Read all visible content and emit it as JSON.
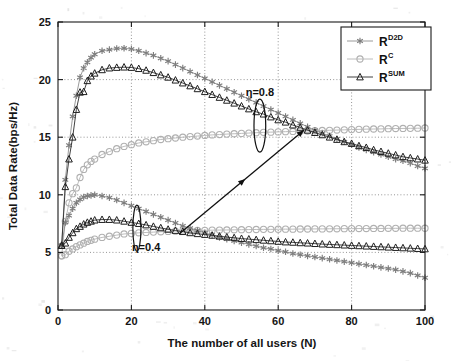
{
  "figure": {
    "background_color": "#ffffff",
    "width": 451,
    "height": 361
  },
  "chart_data": {
    "type": "line",
    "title": "",
    "xlabel": "The number of all users (N)",
    "ylabel": "Total Data Rate(bps/Hz)",
    "xlim": [
      0,
      100
    ],
    "ylim": [
      0,
      25
    ],
    "xticks": [
      0,
      20,
      40,
      60,
      80,
      100
    ],
    "yticks": [
      0,
      5,
      10,
      15,
      20,
      25
    ],
    "grid": true,
    "grid_style": "dotted",
    "legend_position": "upper right",
    "legend_entries": [
      {
        "base": "R",
        "sup": "D2D",
        "marker": "asterisk",
        "color": "#8f8f8f"
      },
      {
        "base": "R",
        "sup": "C",
        "marker": "circle",
        "color": "#b4b4b4"
      },
      {
        "base": "R",
        "sup": "SUM",
        "marker": "triangle",
        "color": "#2b2b2b"
      }
    ],
    "x": [
      1,
      2,
      3,
      4,
      5,
      6,
      7,
      8,
      9,
      10,
      12,
      14,
      16,
      18,
      20,
      22,
      24,
      26,
      28,
      30,
      32,
      34,
      36,
      38,
      40,
      42,
      44,
      46,
      48,
      50,
      52,
      54,
      56,
      58,
      60,
      62,
      64,
      66,
      68,
      70,
      72,
      74,
      76,
      78,
      80,
      82,
      84,
      86,
      88,
      90,
      92,
      94,
      96,
      98,
      100
    ],
    "series": [
      {
        "name": "R^D2D (eta=0.8)",
        "group": "eta_0.8",
        "marker": "asterisk",
        "color": "#8f8f8f",
        "values": [
          5.6,
          11.3,
          14.3,
          16.8,
          18.6,
          20.2,
          21.0,
          21.5,
          21.9,
          22.2,
          22.5,
          22.6,
          22.7,
          22.72,
          22.65,
          22.5,
          22.3,
          22.1,
          21.85,
          21.6,
          21.3,
          21.0,
          20.7,
          20.4,
          20.1,
          19.8,
          19.5,
          19.2,
          18.9,
          18.6,
          18.3,
          18.0,
          17.7,
          17.4,
          17.1,
          16.8,
          16.5,
          16.2,
          15.9,
          15.6,
          15.35,
          15.1,
          14.85,
          14.6,
          14.35,
          14.1,
          13.9,
          13.7,
          13.5,
          13.3,
          13.1,
          12.95,
          12.75,
          12.5,
          12.3
        ]
      },
      {
        "name": "R^C (eta=0.8)",
        "group": "eta_0.8",
        "marker": "circle",
        "color": "#b4b4b4",
        "values": [
          4.7,
          7.7,
          9.3,
          10.1,
          10.6,
          11.5,
          12.2,
          12.6,
          12.9,
          13.1,
          13.5,
          13.75,
          14.0,
          14.2,
          14.35,
          14.5,
          14.6,
          14.7,
          14.8,
          14.87,
          14.93,
          15.0,
          15.05,
          15.1,
          15.15,
          15.2,
          15.23,
          15.27,
          15.3,
          15.33,
          15.36,
          15.39,
          15.42,
          15.44,
          15.46,
          15.48,
          15.5,
          15.52,
          15.54,
          15.56,
          15.58,
          15.6,
          15.62,
          15.64,
          15.66,
          15.68,
          15.7,
          15.71,
          15.72,
          15.74,
          15.75,
          15.76,
          15.77,
          15.78,
          15.8
        ]
      },
      {
        "name": "R^SUM (eta=0.8)",
        "group": "eta_0.8",
        "marker": "triangle",
        "color": "#2b2b2b",
        "values": [
          5.6,
          10.7,
          13.1,
          15.0,
          17.4,
          18.9,
          18.95,
          19.9,
          20.3,
          20.55,
          20.85,
          21.0,
          21.05,
          21.08,
          21.05,
          20.95,
          20.8,
          20.6,
          20.4,
          20.2,
          19.95,
          19.7,
          19.45,
          19.2,
          18.95,
          18.7,
          18.45,
          18.2,
          17.95,
          17.7,
          17.45,
          17.2,
          17.0,
          16.75,
          16.5,
          16.3,
          16.05,
          15.85,
          15.6,
          15.4,
          15.2,
          15.0,
          14.8,
          14.6,
          14.45,
          14.25,
          14.1,
          13.9,
          13.75,
          13.6,
          13.45,
          13.3,
          13.2,
          13.1,
          13.0
        ]
      },
      {
        "name": "R^D2D (eta=0.4)",
        "group": "eta_0.4",
        "marker": "asterisk",
        "color": "#8f8f8f",
        "values": [
          5.6,
          7.6,
          8.2,
          8.8,
          9.3,
          9.6,
          9.8,
          9.9,
          9.95,
          10.0,
          9.9,
          9.75,
          9.55,
          9.3,
          9.05,
          8.8,
          8.55,
          8.3,
          8.05,
          7.8,
          7.55,
          7.3,
          7.1,
          6.9,
          6.7,
          6.5,
          6.3,
          6.15,
          6.0,
          5.85,
          5.7,
          5.55,
          5.4,
          5.3,
          5.15,
          5.05,
          4.9,
          4.8,
          4.7,
          4.6,
          4.5,
          4.4,
          4.3,
          4.2,
          4.1,
          4.0,
          3.9,
          3.8,
          3.7,
          3.6,
          3.5,
          3.35,
          3.2,
          3.0,
          2.8
        ]
      },
      {
        "name": "R^C (eta=0.4)",
        "group": "eta_0.4",
        "marker": "circle",
        "color": "#b4b4b4",
        "values": [
          4.7,
          4.8,
          5.1,
          5.3,
          5.5,
          5.65,
          5.8,
          5.95,
          6.05,
          6.15,
          6.3,
          6.4,
          6.5,
          6.6,
          6.65,
          6.7,
          6.73,
          6.76,
          6.79,
          6.82,
          6.84,
          6.86,
          6.88,
          6.9,
          6.92,
          6.93,
          6.94,
          6.95,
          6.96,
          6.97,
          6.98,
          6.99,
          7.0,
          7.0,
          7.01,
          7.02,
          7.02,
          7.03,
          7.03,
          7.04,
          7.04,
          7.05,
          7.05,
          7.06,
          7.06,
          7.07,
          7.07,
          7.08,
          7.08,
          7.09,
          7.09,
          7.1,
          7.1,
          7.1,
          7.1
        ]
      },
      {
        "name": "R^SUM (eta=0.4)",
        "group": "eta_0.4",
        "marker": "triangle",
        "color": "#2b2b2b",
        "values": [
          5.6,
          5.8,
          6.3,
          6.7,
          7.05,
          7.25,
          7.45,
          7.6,
          7.7,
          7.8,
          7.85,
          7.85,
          7.8,
          7.7,
          7.6,
          7.5,
          7.38,
          7.25,
          7.13,
          7.0,
          6.9,
          6.8,
          6.7,
          6.62,
          6.55,
          6.48,
          6.4,
          6.33,
          6.27,
          6.2,
          6.15,
          6.1,
          6.05,
          6.0,
          5.95,
          5.9,
          5.87,
          5.83,
          5.8,
          5.76,
          5.72,
          5.69,
          5.66,
          5.63,
          5.6,
          5.57,
          5.54,
          5.51,
          5.48,
          5.45,
          5.42,
          5.39,
          5.36,
          5.33,
          5.3
        ]
      }
    ],
    "annotations": [
      {
        "id": "eta-high",
        "text": "η=0.8",
        "x": 55,
        "y": 18.6,
        "marker": "ellipse",
        "ellipse_x": 55,
        "ellipse_y": 16.0,
        "ellipse_rx": 1.6,
        "ellipse_ry": 2.3
      },
      {
        "id": "eta-low",
        "text": "η=0.4",
        "x": 24,
        "y": 5.1,
        "marker": "ellipse",
        "ellipse_x": 21.5,
        "ellipse_y": 7.1,
        "ellipse_rx": 1.1,
        "ellipse_ry": 2.0
      },
      {
        "id": "connector",
        "text": "",
        "marker": "double-arrow",
        "x1": 33,
        "y1": 6.6,
        "x2": 67,
        "y2": 15.6
      }
    ]
  }
}
